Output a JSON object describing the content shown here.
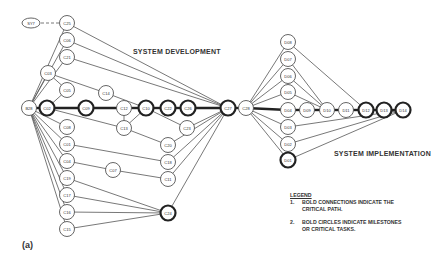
{
  "titles": {
    "development": "SYSTEM DEVELOPMENT",
    "implementation": "SYSTEM IMPLEMENTATION",
    "figure": "(a)"
  },
  "legend": {
    "title": "LEGEND",
    "items": [
      {
        "num": "1.",
        "line1": "BOLD CONNECTIONS INDICATE THE",
        "line2": "CRITICAL PATH."
      },
      {
        "num": "2.",
        "line1": "BOLD CIRCLES INDICATE MILESTONES",
        "line2": "OR CRITICAL TASKS."
      }
    ]
  },
  "nodes": [
    {
      "id": "SY7",
      "x": 31,
      "y": 23,
      "shape": "ellipse",
      "bold": false
    },
    {
      "id": "C25",
      "x": 67,
      "y": 23,
      "bold": false
    },
    {
      "id": "C06",
      "x": 67,
      "y": 40,
      "bold": false
    },
    {
      "id": "C21",
      "x": 67,
      "y": 57,
      "bold": false
    },
    {
      "id": "C03",
      "x": 48,
      "y": 73,
      "bold": false
    },
    {
      "id": "C05",
      "x": 67,
      "y": 90,
      "bold": false
    },
    {
      "id": "B28",
      "x": 29,
      "y": 108,
      "bold": false
    },
    {
      "id": "C02",
      "x": 47,
      "y": 108,
      "bold": true
    },
    {
      "id": "C09",
      "x": 86,
      "y": 108,
      "bold": true
    },
    {
      "id": "C14",
      "x": 106,
      "y": 93,
      "bold": false
    },
    {
      "id": "C12",
      "x": 124,
      "y": 108,
      "bold": false
    },
    {
      "id": "C10",
      "x": 146,
      "y": 108,
      "bold": true
    },
    {
      "id": "C22",
      "x": 168,
      "y": 108,
      "bold": true
    },
    {
      "id": "C26",
      "x": 188,
      "y": 108,
      "bold": true
    },
    {
      "id": "C23",
      "x": 187,
      "y": 128,
      "bold": false
    },
    {
      "id": "C13",
      "x": 124,
      "y": 128,
      "bold": false
    },
    {
      "id": "C08",
      "x": 67,
      "y": 127,
      "bold": false
    },
    {
      "id": "C01",
      "x": 67,
      "y": 144,
      "bold": false
    },
    {
      "id": "C20",
      "x": 168,
      "y": 145,
      "bold": false
    },
    {
      "id": "C04",
      "x": 67,
      "y": 161,
      "bold": false
    },
    {
      "id": "C07",
      "x": 113,
      "y": 170,
      "bold": false
    },
    {
      "id": "C18",
      "x": 168,
      "y": 162,
      "bold": false
    },
    {
      "id": "C19",
      "x": 67,
      "y": 178,
      "bold": false
    },
    {
      "id": "C11",
      "x": 168,
      "y": 179,
      "bold": false
    },
    {
      "id": "C17",
      "x": 67,
      "y": 195,
      "bold": false
    },
    {
      "id": "C24",
      "x": 168,
      "y": 213,
      "bold": true
    },
    {
      "id": "C16",
      "x": 67,
      "y": 212,
      "bold": false
    },
    {
      "id": "C15",
      "x": 67,
      "y": 229,
      "bold": false
    },
    {
      "id": "C27",
      "x": 228,
      "y": 108,
      "bold": true
    },
    {
      "id": "C28",
      "x": 246,
      "y": 108,
      "bold": false
    },
    {
      "id": "D08",
      "x": 288,
      "y": 42,
      "bold": false
    },
    {
      "id": "D07",
      "x": 288,
      "y": 59,
      "bold": false
    },
    {
      "id": "D06",
      "x": 288,
      "y": 76,
      "bold": false
    },
    {
      "id": "D05",
      "x": 288,
      "y": 92,
      "bold": false
    },
    {
      "id": "D04",
      "x": 288,
      "y": 110,
      "bold": false
    },
    {
      "id": "D09",
      "x": 307,
      "y": 110,
      "bold": false
    },
    {
      "id": "D10",
      "x": 327,
      "y": 110,
      "bold": false
    },
    {
      "id": "D11",
      "x": 346,
      "y": 110,
      "bold": false
    },
    {
      "id": "D12",
      "x": 366,
      "y": 110,
      "bold": true
    },
    {
      "id": "D13",
      "x": 384,
      "y": 110,
      "bold": true
    },
    {
      "id": "D14",
      "x": 403,
      "y": 110,
      "bold": true
    },
    {
      "id": "D03",
      "x": 288,
      "y": 127,
      "bold": false
    },
    {
      "id": "D02",
      "x": 288,
      "y": 144,
      "bold": false
    },
    {
      "id": "D01",
      "x": 288,
      "y": 160,
      "bold": true
    }
  ],
  "edges": [
    [
      "SY7",
      "C25",
      "dashed"
    ],
    [
      "B28",
      "C25",
      ""
    ],
    [
      "B28",
      "C06",
      ""
    ],
    [
      "B28",
      "C21",
      ""
    ],
    [
      "B28",
      "C03",
      ""
    ],
    [
      "B28",
      "C02",
      "bold"
    ],
    [
      "B28",
      "C08",
      ""
    ],
    [
      "B28",
      "C01",
      ""
    ],
    [
      "B28",
      "C04",
      ""
    ],
    [
      "B28",
      "C19",
      ""
    ],
    [
      "B28",
      "C17",
      ""
    ],
    [
      "B28",
      "C16",
      ""
    ],
    [
      "B28",
      "C15",
      ""
    ],
    [
      "C03",
      "C05",
      ""
    ],
    [
      "C03",
      "C14",
      ""
    ],
    [
      "C05",
      "C02",
      ""
    ],
    [
      "C02",
      "C09",
      "bold"
    ],
    [
      "C09",
      "C12",
      "bold"
    ],
    [
      "C12",
      "C10",
      "bold"
    ],
    [
      "C10",
      "C22",
      "bold"
    ],
    [
      "C22",
      "C26",
      "bold"
    ],
    [
      "C26",
      "C27",
      "bold"
    ],
    [
      "C14",
      "C10",
      ""
    ],
    [
      "C02",
      "C13",
      ""
    ],
    [
      "C12",
      "C13",
      ""
    ],
    [
      "C10",
      "C13",
      ""
    ],
    [
      "C13",
      "C20",
      ""
    ],
    [
      "C10",
      "C23",
      ""
    ],
    [
      "C23",
      "C27",
      ""
    ],
    [
      "C20",
      "C27",
      ""
    ],
    [
      "C18",
      "C27",
      ""
    ],
    [
      "C11",
      "C27",
      ""
    ],
    [
      "C24",
      "C27",
      ""
    ],
    [
      "C25",
      "C27",
      ""
    ],
    [
      "C06",
      "C27",
      ""
    ],
    [
      "C21",
      "C27",
      ""
    ],
    [
      "C01",
      "C18",
      ""
    ],
    [
      "C04",
      "C07",
      ""
    ],
    [
      "C07",
      "C11",
      ""
    ],
    [
      "C19",
      "C24",
      ""
    ],
    [
      "C17",
      "C24",
      ""
    ],
    [
      "C16",
      "C24",
      ""
    ],
    [
      "C15",
      "C24",
      ""
    ],
    [
      "C27",
      "C28",
      "bold"
    ],
    [
      "C28",
      "D08",
      ""
    ],
    [
      "C28",
      "D07",
      ""
    ],
    [
      "C28",
      "D06",
      ""
    ],
    [
      "C28",
      "D05",
      ""
    ],
    [
      "C28",
      "D04",
      "bold"
    ],
    [
      "C28",
      "D03",
      ""
    ],
    [
      "C28",
      "D02",
      ""
    ],
    [
      "C28",
      "D01",
      ""
    ],
    [
      "D04",
      "D09",
      "bold"
    ],
    [
      "D09",
      "D10",
      "bold"
    ],
    [
      "D10",
      "D11",
      "bold"
    ],
    [
      "D11",
      "D12",
      "bold"
    ],
    [
      "D12",
      "D13",
      "bold"
    ],
    [
      "D13",
      "D14",
      "bold"
    ],
    [
      "D07",
      "D10",
      ""
    ],
    [
      "D06",
      "D10",
      ""
    ],
    [
      "D05",
      "D10",
      ""
    ],
    [
      "D08",
      "D12",
      ""
    ],
    [
      "D03",
      "D14",
      ""
    ],
    [
      "D02",
      "D14",
      ""
    ],
    [
      "D01",
      "D14",
      ""
    ]
  ]
}
